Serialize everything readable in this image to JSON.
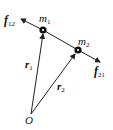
{
  "diagram": {
    "origin": {
      "label": "O",
      "x": 31,
      "y": 114
    },
    "masses": [
      {
        "id": "m1",
        "label": "m",
        "subscript": "1",
        "x": 43,
        "y": 30
      },
      {
        "id": "m2",
        "label": "m",
        "subscript": "2",
        "x": 78,
        "y": 50
      }
    ],
    "position_vectors": [
      {
        "label": "r",
        "subscript": "1"
      },
      {
        "label": "r",
        "subscript": "2"
      }
    ],
    "forces": [
      {
        "label": "f",
        "subscript": "12",
        "direction": "m1 away from m2"
      },
      {
        "label": "f",
        "subscript": "21",
        "direction": "m2 away from m1"
      }
    ],
    "colors": {
      "line": "#222222",
      "mass_fill": "#111111",
      "mass_core": "#ffffff"
    }
  }
}
